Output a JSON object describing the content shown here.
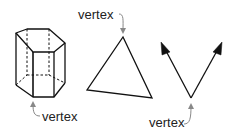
{
  "figure": {
    "shapes": [
      {
        "name": "hexagonal-prism",
        "label": "vertex"
      },
      {
        "name": "triangle",
        "label": "vertex"
      },
      {
        "name": "angle",
        "label": "vertex"
      }
    ]
  },
  "colors": {
    "stroke": "#111111",
    "pointer": "#888888",
    "text": "#222222"
  }
}
